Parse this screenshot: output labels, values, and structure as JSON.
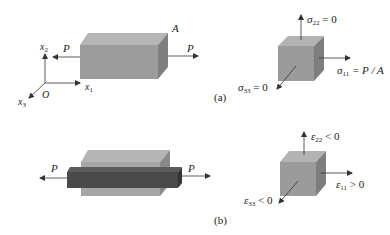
{
  "colors": {
    "front": "#9c9c9c",
    "top": "#b4b4b4",
    "side": "#7e7e7e",
    "dark_front": "#4a4a4a",
    "dark_top": "#5a5a5a",
    "dark_side": "#333333",
    "arrow": "#333333"
  },
  "panel_a": {
    "caption": "(a)",
    "axes": {
      "x1": "x",
      "x1_sub": "1",
      "x2": "x",
      "x2_sub": "2",
      "x3": "x",
      "x3_sub": "3",
      "origin": "O"
    },
    "block_area_label": "A",
    "load_left": "P",
    "load_right": "P",
    "cube": {
      "sigma22": {
        "sym": "σ",
        "sub": "22",
        "rel": " = 0"
      },
      "sigma11": {
        "sym": "σ",
        "sub": "11",
        "rel": " = P / A"
      },
      "sigma33": {
        "sym": "σ",
        "sub": "33",
        "rel": " = 0"
      }
    }
  },
  "panel_b": {
    "caption": "(b)",
    "load_left": "P",
    "load_right": "P",
    "cube": {
      "eps22": {
        "sym": "ε",
        "sub": "22",
        "rel": " < 0"
      },
      "eps11": {
        "sym": "ε",
        "sub": "11",
        "rel": " > 0"
      },
      "eps33": {
        "sym": "ε",
        "sub": "33",
        "rel": " < 0"
      }
    }
  }
}
